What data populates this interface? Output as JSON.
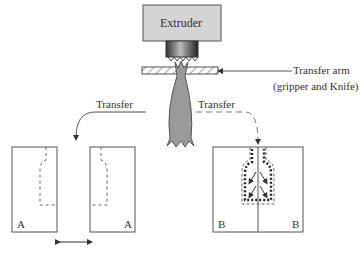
{
  "diagram": {
    "extruder_label": "Extruder",
    "transfer_arm_label_line1": "Transfer arm",
    "transfer_arm_label_line2": "(gripper and Knife)",
    "transfer_left_label": "Transfer",
    "transfer_right_label": "Transfer",
    "mold_a_left_label": "A",
    "mold_a_right_label": "A",
    "mold_b_left_label": "B",
    "mold_b_right_label": "B"
  },
  "colors": {
    "extruder_fill": "#d4d4d4",
    "parison_fill": "#9a9a9a",
    "line": "#555555"
  }
}
